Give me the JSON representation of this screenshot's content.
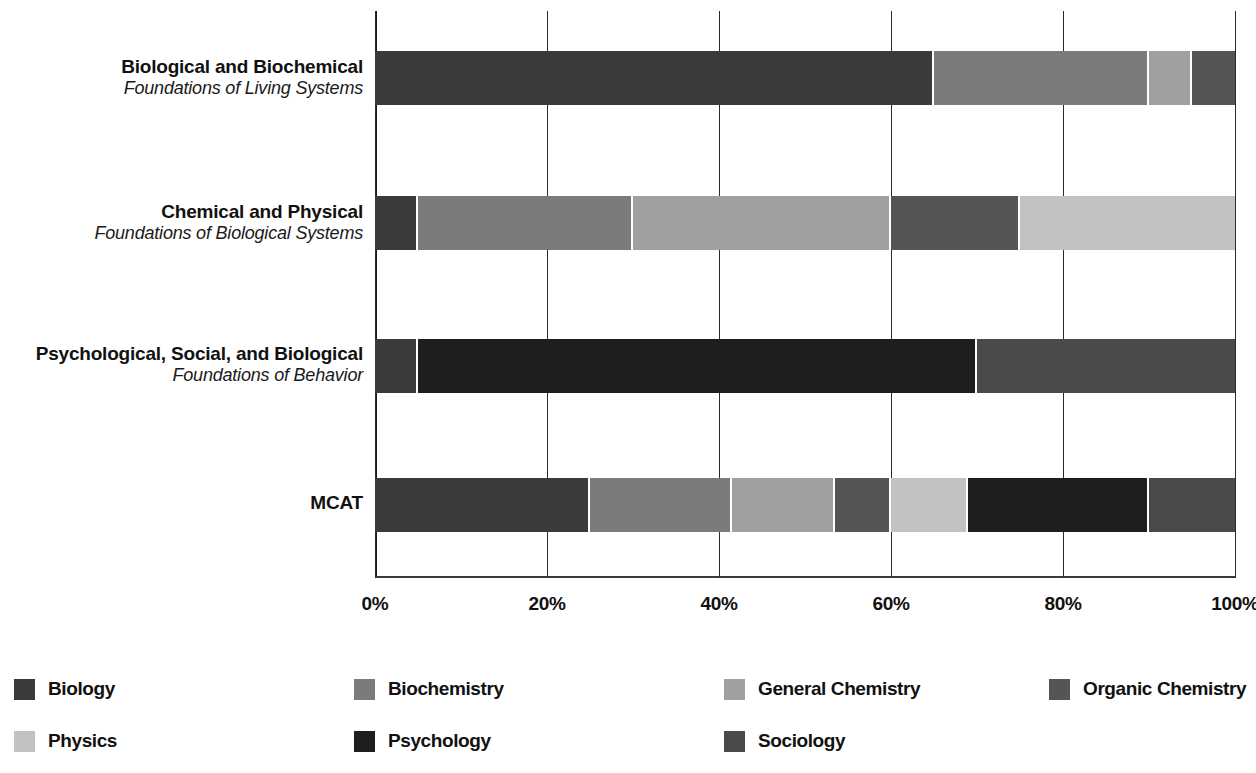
{
  "chart_data": {
    "type": "bar",
    "orientation": "horizontal",
    "stacked": true,
    "normalized_percent": true,
    "title": "",
    "subtitle": "",
    "xlabel": "",
    "ylabel": "",
    "xlim": [
      0,
      100
    ],
    "xticks": [
      0,
      20,
      40,
      60,
      80,
      100
    ],
    "xtick_labels": [
      "0%",
      "20%",
      "40%",
      "60%",
      "80%",
      "100%"
    ],
    "grid": true,
    "grid_axis": "x",
    "legend_position": "bottom",
    "categories": [
      {
        "title": "Biological and Biochemical",
        "subtitle": "Foundations of Living Systems"
      },
      {
        "title": "Chemical and Physical",
        "subtitle": "Foundations of Biological Systems"
      },
      {
        "title": "Psychological, Social, and Biological",
        "subtitle": "Foundations of Behavior"
      },
      {
        "title": "MCAT",
        "subtitle": ""
      }
    ],
    "series": [
      {
        "name": "Biology",
        "color": "#3a3a3a",
        "values": [
          65,
          5,
          5,
          25
        ]
      },
      {
        "name": "Biochemistry",
        "color": "#7b7b7b",
        "values": [
          25,
          25,
          0,
          16.5
        ]
      },
      {
        "name": "General Chemistry",
        "color": "#a0a0a0",
        "values": [
          5,
          30,
          0,
          12
        ]
      },
      {
        "name": "Organic Chemistry",
        "color": "#555555",
        "values": [
          5,
          15,
          0,
          6.5
        ]
      },
      {
        "name": "Physics",
        "color": "#c2c2c2",
        "values": [
          0,
          25,
          0,
          9
        ]
      },
      {
        "name": "Psychology",
        "color": "#1e1e1e",
        "values": [
          0,
          0,
          65,
          21
        ]
      },
      {
        "name": "Sociology",
        "color": "#4a4a4a",
        "values": [
          0,
          0,
          30,
          10
        ]
      }
    ],
    "bars": [
      {
        "category_index": 0,
        "segments": [
          {
            "series": "Biology",
            "start": 0,
            "end": 65,
            "value": 65,
            "color": "#3a3a3a"
          },
          {
            "series": "Biochemistry",
            "start": 65,
            "end": 90,
            "value": 25,
            "color": "#7b7b7b"
          },
          {
            "series": "General Chemistry",
            "start": 90,
            "end": 95,
            "value": 5,
            "color": "#a0a0a0"
          },
          {
            "series": "Organic Chemistry",
            "start": 95,
            "end": 100,
            "value": 5,
            "color": "#555555"
          }
        ]
      },
      {
        "category_index": 1,
        "segments": [
          {
            "series": "Biology",
            "start": 0,
            "end": 5,
            "value": 5,
            "color": "#3a3a3a"
          },
          {
            "series": "Biochemistry",
            "start": 5,
            "end": 30,
            "value": 25,
            "color": "#7b7b7b"
          },
          {
            "series": "General Chemistry",
            "start": 30,
            "end": 60,
            "value": 30,
            "color": "#a0a0a0"
          },
          {
            "series": "Organic Chemistry",
            "start": 60,
            "end": 75,
            "value": 15,
            "color": "#555555"
          },
          {
            "series": "Physics",
            "start": 75,
            "end": 100,
            "value": 25,
            "color": "#c2c2c2"
          }
        ]
      },
      {
        "category_index": 2,
        "segments": [
          {
            "series": "Biology",
            "start": 0,
            "end": 5,
            "value": 5,
            "color": "#3a3a3a"
          },
          {
            "series": "Psychology",
            "start": 5,
            "end": 70,
            "value": 65,
            "color": "#1e1e1e"
          },
          {
            "series": "Sociology",
            "start": 70,
            "end": 100,
            "value": 30,
            "color": "#4a4a4a"
          }
        ]
      },
      {
        "category_index": 3,
        "segments": [
          {
            "series": "Biology",
            "start": 0,
            "end": 25,
            "value": 25,
            "color": "#3a3a3a"
          },
          {
            "series": "Biochemistry",
            "start": 25,
            "end": 41.5,
            "value": 16.5,
            "color": "#7b7b7b"
          },
          {
            "series": "General Chemistry",
            "start": 41.5,
            "end": 53.5,
            "value": 12,
            "color": "#a0a0a0"
          },
          {
            "series": "Organic Chemistry",
            "start": 53.5,
            "end": 60,
            "value": 6.5,
            "color": "#555555"
          },
          {
            "series": "Physics",
            "start": 60,
            "end": 69,
            "value": 9,
            "color": "#c2c2c2"
          },
          {
            "series": "Psychology",
            "start": 69,
            "end": 90,
            "value": 21,
            "color": "#1e1e1e"
          },
          {
            "series": "Sociology",
            "start": 90,
            "end": 100,
            "value": 10,
            "color": "#4a4a4a"
          }
        ]
      }
    ]
  },
  "legend": {
    "items": [
      {
        "label": "Biology",
        "color": "#3a3a3a",
        "col": 0,
        "row": 0
      },
      {
        "label": "Biochemistry",
        "color": "#7b7b7b",
        "col": 1,
        "row": 0
      },
      {
        "label": "General Chemistry",
        "color": "#a0a0a0",
        "col": 2,
        "row": 0
      },
      {
        "label": "Organic Chemistry",
        "color": "#555555",
        "col": 3,
        "row": 0
      },
      {
        "label": "Physics",
        "color": "#c2c2c2",
        "col": 0,
        "row": 1
      },
      {
        "label": "Psychology",
        "color": "#1e1e1e",
        "col": 1,
        "row": 1
      },
      {
        "label": "Sociology",
        "color": "#4a4a4a",
        "col": 2,
        "row": 1
      }
    ]
  },
  "geometry": {
    "plot_left": 375,
    "plot_width": 860,
    "bar_tops": [
      40,
      185,
      328,
      467
    ],
    "bar_height": 54,
    "label_centers": [
      77,
      222,
      364,
      503
    ],
    "legend_col_x": [
      0,
      340,
      710,
      1035
    ],
    "legend_row_y": [
      10,
      62
    ]
  }
}
